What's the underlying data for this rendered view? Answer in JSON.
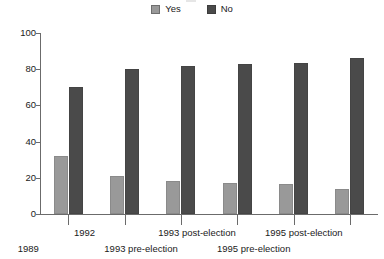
{
  "chart_data": {
    "type": "bar",
    "title": "",
    "xlabel": "",
    "ylabel": "",
    "ylim": [
      0,
      100
    ],
    "yticks": [
      0,
      20,
      40,
      60,
      80,
      100
    ],
    "grid": false,
    "legend_position": "top-center",
    "categories": [
      "1989",
      "1992",
      "1993 pre-election",
      "1993 post-election",
      "1995 pre-election",
      "1995 post-election"
    ],
    "series": [
      {
        "name": "Yes",
        "color": "#999999",
        "values": [
          32,
          21,
          18,
          17,
          16.5,
          14
        ]
      },
      {
        "name": "No",
        "color": "#4a4a4a",
        "values": [
          70,
          80,
          82,
          83,
          83.5,
          86
        ]
      }
    ]
  },
  "legend": {
    "items": [
      {
        "label": "Yes",
        "color": "#999999"
      },
      {
        "label": "No",
        "color": "#4a4a4a"
      }
    ]
  },
  "axis": {
    "y_tick_labels": [
      "100",
      "80",
      "60",
      "40",
      "20",
      "0"
    ]
  },
  "x_axis": {
    "labels": [
      {
        "text": "1989",
        "row": 1
      },
      {
        "text": "1992",
        "row": 0
      },
      {
        "text": "1993 pre-election",
        "row": 1
      },
      {
        "text": "1993 post-election",
        "row": 0
      },
      {
        "text": "1995 pre-election",
        "row": 1
      },
      {
        "text": "1995 post-election",
        "row": 0
      }
    ]
  }
}
